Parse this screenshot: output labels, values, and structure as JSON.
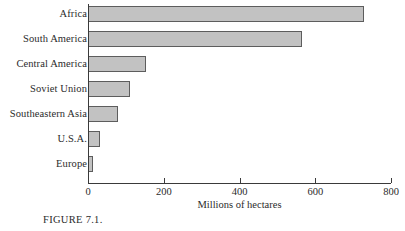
{
  "figure": {
    "caption": "FIGURE 7.1."
  },
  "chart_data": {
    "type": "bar",
    "orientation": "horizontal",
    "title": "",
    "xlabel": "Millions of hectares",
    "ylabel": "",
    "xlim": [
      0,
      800
    ],
    "xticks": [
      0,
      200,
      400,
      600,
      800
    ],
    "xtick_labels": [
      "0",
      "200",
      "400",
      "600",
      "800"
    ],
    "grid": false,
    "legend": false,
    "categories": [
      "Africa",
      "South America",
      "Central America",
      "Soviet Union",
      "Southeastern Asia",
      "U.S.A.",
      "Europe"
    ],
    "values": [
      728,
      564,
      154,
      111,
      80,
      32,
      12
    ],
    "bar_fill_color": "#c2c2c2",
    "bar_edge_color": "#5d5d5d",
    "axis_color": "#3a3a3a"
  }
}
